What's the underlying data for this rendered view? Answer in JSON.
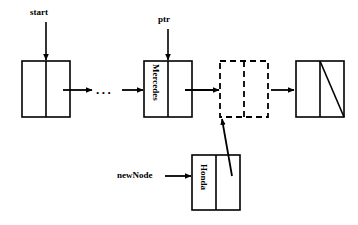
{
  "diagram": {
    "stroke_color": "#000000",
    "background_color": "#ffffff",
    "pointer_labels": [
      {
        "id": "start",
        "text": "start",
        "points_to": "node-head",
        "x": 30,
        "y": 8
      },
      {
        "id": "ptr",
        "text": "ptr",
        "points_to": "node-mercedes",
        "x": 158,
        "y": 15
      },
      {
        "id": "newNode",
        "text": "newNode",
        "points_to": "node-honda",
        "x": 117,
        "y": 168
      }
    ],
    "nodes": [
      {
        "id": "node-head",
        "label": "",
        "style": "solid",
        "x": 22,
        "y": 61,
        "w": 48,
        "h": 56,
        "divider_x": 46,
        "null_marker": false
      },
      {
        "id": "node-mercedes",
        "label": "Mercedes",
        "style": "solid",
        "x": 144,
        "y": 61,
        "w": 48,
        "h": 56,
        "divider_x": 168,
        "null_marker": false
      },
      {
        "id": "node-new-slot",
        "label": "",
        "style": "dashed",
        "x": 220,
        "y": 61,
        "w": 48,
        "h": 56,
        "divider_x": 244,
        "null_marker": false
      },
      {
        "id": "node-tail",
        "label": "",
        "style": "solid",
        "x": 296,
        "y": 61,
        "w": 48,
        "h": 56,
        "divider_x": 320,
        "null_marker": true
      },
      {
        "id": "node-honda",
        "label": "Honda",
        "style": "solid",
        "x": 192,
        "y": 155,
        "w": 48,
        "h": 55,
        "divider_x": 216,
        "null_marker": false
      }
    ],
    "ellipsis": {
      "text": "...",
      "x": 96,
      "y": 83
    },
    "connections": [
      {
        "id": "head-to-ellipsis",
        "from": "node-head",
        "to": "ellipsis"
      },
      {
        "id": "ellipsis-to-mercedes",
        "from": "ellipsis",
        "to": "node-mercedes"
      },
      {
        "id": "mercedes-to-newslot",
        "from": "node-mercedes",
        "to": "node-new-slot"
      },
      {
        "id": "newslot-to-tail",
        "from": "node-new-slot",
        "to": "node-tail"
      },
      {
        "id": "honda-to-newslot",
        "from": "node-honda",
        "to": "node-new-slot"
      }
    ]
  }
}
